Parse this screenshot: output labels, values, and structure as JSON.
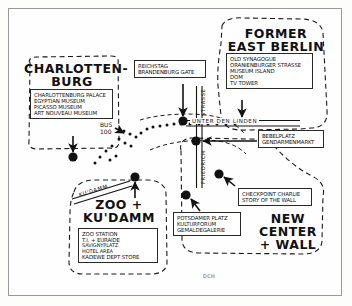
{
  "map": {
    "title_hidden": "Berlin tourist overview hand-drawn map",
    "credit": "DCH",
    "colors": {
      "ink": "#111111",
      "paper": "#fefefe",
      "frame": "#9a9a9a",
      "dashed_zone": "#1a1a1a"
    }
  },
  "zones": [
    {
      "id": "charlottenburg",
      "title": "CHARLOTTEN-\nBURG",
      "items": [
        "CHARLOTTENBURG PALACE",
        "EGYPTIAN MUSEUM",
        "PICASSO MUSEUM",
        "ART NOUVEAU MUSEUM"
      ]
    },
    {
      "id": "former-east-berlin",
      "title": "FORMER\nEAST BERLIN",
      "items": [
        "OLD SYNAGOGUE",
        "ORANIENBURGER STRASSE",
        "MUSEUM ISLAND",
        "DOM",
        "TV TOWER"
      ]
    },
    {
      "id": "zoo-kudamm",
      "title": "ZOO +\nKU'DAMM",
      "items": [
        "ZOO STATION",
        "T.I. + EURAIDE",
        "SAVIGNYPLATZ",
        "HOTEL AREA",
        "KADEWE DEPT STORE"
      ]
    },
    {
      "id": "new-center-wall",
      "title": "NEW CENTER\n+ WALL",
      "items": []
    }
  ],
  "callouts": [
    {
      "id": "reichstag",
      "items": [
        "REICHSTAG",
        "BRANDENBURG GATE"
      ]
    },
    {
      "id": "bebelplatz",
      "items": [
        "BEBELPLATZ",
        "GENDARMENMARKT"
      ]
    },
    {
      "id": "checkpoint-charlie",
      "items": [
        "CHECKPOINT CHARLIE",
        "STORY OF THE WALL"
      ]
    },
    {
      "id": "potsdamer-platz",
      "items": [
        "POTSDAMER PLATZ",
        "KULTURFORUM",
        "GEMALDEGALERIE"
      ]
    }
  ],
  "streets": [
    {
      "id": "unter-den-linden",
      "label": "UNTER DEN LINDEN"
    },
    {
      "id": "friedrichstrasse-north",
      "label": "STRASSE"
    },
    {
      "id": "friedrichstrasse-south",
      "label": "FRIEDRICH"
    },
    {
      "id": "kudamm-street",
      "label": "KU'DAMM"
    }
  ],
  "notes": [
    {
      "id": "bus-100",
      "label": "BUS\n100"
    }
  ]
}
